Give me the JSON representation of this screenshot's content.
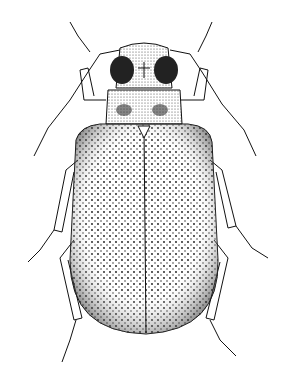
{
  "image": {
    "subject": "beetle illustration",
    "style": "black-and-white stippled scientific drawing",
    "background": "#ffffff",
    "ink": "#111111"
  }
}
